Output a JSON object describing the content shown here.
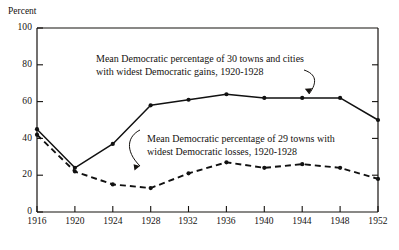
{
  "figure": {
    "y_axis_title": "Percent",
    "annotations": [
      {
        "id": "gains",
        "line1": "Mean Democratic percentage of 30 towns and cities",
        "line2": "with widest Democratic gains, 1920-1928"
      },
      {
        "id": "losses",
        "line1": "Mean Democratic percentage of 29 towns with",
        "line2": "widest Democratic losses, 1920-1928"
      }
    ]
  },
  "chart_data": {
    "type": "line",
    "title": "",
    "xlabel": "",
    "ylabel": "Percent",
    "x": [
      1916,
      1920,
      1924,
      1928,
      1932,
      1936,
      1940,
      1944,
      1948,
      1952
    ],
    "xtick_labels": [
      "1916",
      "1920",
      "1924",
      "1928",
      "1932",
      "1936",
      "1940",
      "1944",
      "1948",
      "1952"
    ],
    "ytick_labels": [
      "0",
      "20",
      "40",
      "60",
      "80",
      "100"
    ],
    "yticks": [
      0,
      20,
      40,
      60,
      80,
      100
    ],
    "ylim": [
      0,
      100
    ],
    "xlim": [
      1916,
      1952
    ],
    "grid": false,
    "legend": "annotations-inline",
    "series": [
      {
        "name": "Mean Democratic percentage of 30 towns and cities with widest Democratic gains, 1920-1928",
        "style": "solid",
        "marker": "filled-circle",
        "color": "#111111",
        "values": [
          45,
          24,
          37,
          58,
          61,
          64,
          62,
          62,
          62,
          50
        ]
      },
      {
        "name": "Mean Democratic percentage of 29 towns with widest Democratic losses, 1920-1928",
        "style": "dashed",
        "marker": "filled-circle",
        "color": "#111111",
        "values": [
          42,
          22,
          15,
          13,
          21,
          27,
          24,
          26,
          24,
          18
        ]
      }
    ]
  }
}
